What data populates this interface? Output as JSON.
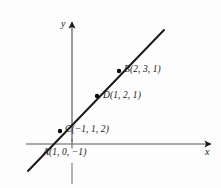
{
  "figure": {
    "background_color": "#fdfdfd",
    "stroke_color": "#1a1a1a"
  },
  "axes": {
    "x_label": "x",
    "y_label": "y",
    "x_axis_y_px": 144,
    "y_axis_x_px": 72,
    "has_arrowheads": true,
    "x_tick_px": 72,
    "y_stub_below_axis": true
  },
  "line": {
    "description": "straight line with positive slope",
    "start_px": [
      28,
      171
    ],
    "end_px": [
      164,
      30
    ]
  },
  "points": [
    {
      "id": "A",
      "label": "A(1, 0, −1)",
      "dot_px": [
        44,
        154
      ],
      "has_dot": false
    },
    {
      "id": "C",
      "label": "C(−1, 1, 2)",
      "dot_px": [
        60,
        131
      ],
      "has_dot": true
    },
    {
      "id": "D",
      "label": "D(1, 2, 1)",
      "dot_px": [
        97,
        96
      ],
      "has_dot": true
    },
    {
      "id": "B",
      "label": "B(2, 3, 1)",
      "dot_px": [
        119,
        71
      ],
      "has_dot": true
    }
  ]
}
